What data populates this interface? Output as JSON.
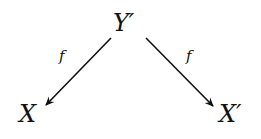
{
  "diagram": {
    "nodes": {
      "top": "Y′",
      "left": "X",
      "right": "X′"
    },
    "edges": [
      {
        "from": "Y′",
        "to": "X",
        "label": "f"
      },
      {
        "from": "Y′",
        "to": "X′",
        "label": "f"
      }
    ]
  }
}
